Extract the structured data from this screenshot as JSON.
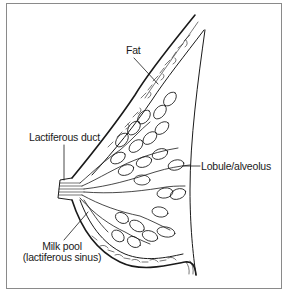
{
  "diagram": {
    "labels": {
      "fat": "Fat",
      "lactiferous_duct": "Lactiferous duct",
      "lobule": "Lobule/alveolus",
      "milk_pool_line1": "Milk pool",
      "milk_pool_line2": "(lactiferous sinus)"
    },
    "colors": {
      "line": "#1a1a1a",
      "frame": "#8a8a8a",
      "background": "#ffffff"
    }
  }
}
